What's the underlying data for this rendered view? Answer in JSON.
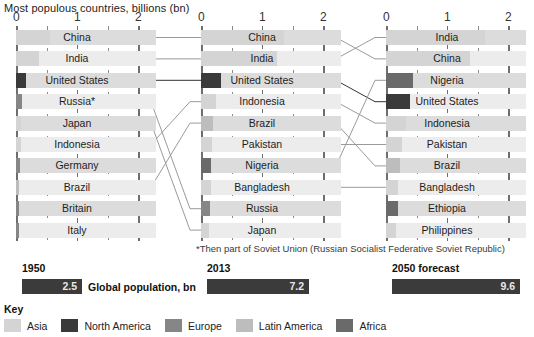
{
  "title": "Most populous countries, billions (bn)",
  "footnote": "*Then part of Soviet Union (Russian Socialist Federative Soviet Republic)",
  "axis": {
    "ticks": [
      "0",
      "1",
      "2"
    ],
    "min": 0,
    "max": 2
  },
  "key": {
    "title": "Key",
    "items": [
      {
        "label": "Asia",
        "color": "#d4d4d4"
      },
      {
        "label": "North America",
        "color": "#3a3a3a"
      },
      {
        "label": "Europe",
        "color": "#868686"
      },
      {
        "label": "Latin America",
        "color": "#bdbdbd"
      },
      {
        "label": "Africa",
        "color": "#6a6a6a"
      }
    ]
  },
  "totals": [
    {
      "year": "1950",
      "value": "2.5",
      "caption": "Global population, bn",
      "width_px": 60
    },
    {
      "year": "2013",
      "value": "7.2",
      "caption": "",
      "width_px": 102
    },
    {
      "year": "2050 forecast",
      "value": "9.6",
      "caption": "",
      "width_px": 128
    }
  ],
  "chart_data": {
    "type": "bar",
    "title": "Most populous countries, billions (bn)",
    "xlabel": "billions (bn)",
    "ylabel": "",
    "xlim": [
      0,
      2
    ],
    "grid": true,
    "legend": [
      "Asia",
      "North America",
      "Europe",
      "Latin America",
      "Africa"
    ],
    "panels": [
      {
        "label": "1950",
        "total": 2.5,
        "categories": [
          "China",
          "India",
          "United States",
          "Russia*",
          "Japan",
          "Indonesia",
          "Germany",
          "Brazil",
          "Britain",
          "Italy"
        ],
        "values": [
          0.55,
          0.37,
          0.16,
          0.1,
          0.08,
          0.08,
          0.07,
          0.05,
          0.05,
          0.05
        ],
        "regions": [
          "Asia",
          "Asia",
          "North America",
          "Europe",
          "Asia",
          "Asia",
          "Europe",
          "Latin America",
          "Europe",
          "Europe"
        ]
      },
      {
        "label": "2013",
        "total": 7.2,
        "categories": [
          "China",
          "India",
          "United States",
          "Indonesia",
          "Brazil",
          "Pakistan",
          "Nigeria",
          "Bangladesh",
          "Russia",
          "Japan"
        ],
        "values": [
          1.36,
          1.25,
          0.32,
          0.25,
          0.2,
          0.18,
          0.17,
          0.16,
          0.14,
          0.13
        ],
        "regions": [
          "Asia",
          "Asia",
          "North America",
          "Asia",
          "Latin America",
          "Asia",
          "Africa",
          "Asia",
          "Europe",
          "Asia"
        ]
      },
      {
        "label": "2050 forecast",
        "total": 9.6,
        "categories": [
          "India",
          "China",
          "Nigeria",
          "United States",
          "Indonesia",
          "Pakistan",
          "Brazil",
          "Bangladesh",
          "Ethiopia",
          "Philippines"
        ],
        "values": [
          1.62,
          1.38,
          0.44,
          0.4,
          0.32,
          0.27,
          0.23,
          0.2,
          0.19,
          0.16
        ],
        "regions": [
          "Asia",
          "Asia",
          "Africa",
          "North America",
          "Asia",
          "Asia",
          "Latin America",
          "Asia",
          "Africa",
          "Asia"
        ]
      }
    ],
    "links": [
      {
        "from_panel": 0,
        "from_index": 0,
        "to_panel": 1,
        "to_index": 0
      },
      {
        "from_panel": 0,
        "from_index": 1,
        "to_panel": 1,
        "to_index": 1
      },
      {
        "from_panel": 0,
        "from_index": 2,
        "to_panel": 1,
        "to_index": 2
      },
      {
        "from_panel": 0,
        "from_index": 3,
        "to_panel": 1,
        "to_index": 8
      },
      {
        "from_panel": 0,
        "from_index": 4,
        "to_panel": 1,
        "to_index": 9
      },
      {
        "from_panel": 0,
        "from_index": 5,
        "to_panel": 1,
        "to_index": 3
      },
      {
        "from_panel": 0,
        "from_index": 7,
        "to_panel": 1,
        "to_index": 4
      },
      {
        "from_panel": 1,
        "from_index": 0,
        "to_panel": 2,
        "to_index": 1
      },
      {
        "from_panel": 1,
        "from_index": 1,
        "to_panel": 2,
        "to_index": 0
      },
      {
        "from_panel": 1,
        "from_index": 2,
        "to_panel": 2,
        "to_index": 3
      },
      {
        "from_panel": 1,
        "from_index": 3,
        "to_panel": 2,
        "to_index": 4
      },
      {
        "from_panel": 1,
        "from_index": 4,
        "to_panel": 2,
        "to_index": 6
      },
      {
        "from_panel": 1,
        "from_index": 5,
        "to_panel": 2,
        "to_index": 5
      },
      {
        "from_panel": 1,
        "from_index": 6,
        "to_panel": 2,
        "to_index": 2
      },
      {
        "from_panel": 1,
        "from_index": 7,
        "to_panel": 2,
        "to_index": 7
      }
    ]
  }
}
